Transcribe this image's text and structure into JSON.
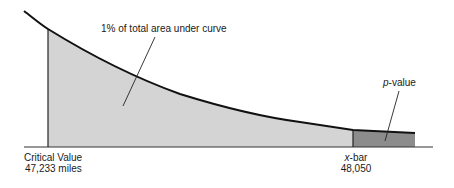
{
  "diagram": {
    "type": "right-tail area under decreasing density curve",
    "colors": {
      "curve": "#111111",
      "critical_region_fill": "#d4d4d4",
      "pvalue_region_fill": "#8c8c8c",
      "axis": "#333333"
    },
    "annotations": {
      "area_label": "1% of total area under curve",
      "pvalue_label_italic": "p",
      "pvalue_label_rest": "-value"
    },
    "markers": {
      "critical": {
        "title": "Critical Value",
        "value": "47,233 miles"
      },
      "xbar": {
        "title_italic": "x",
        "title_rest": "-bar",
        "value": "48,050"
      }
    }
  }
}
